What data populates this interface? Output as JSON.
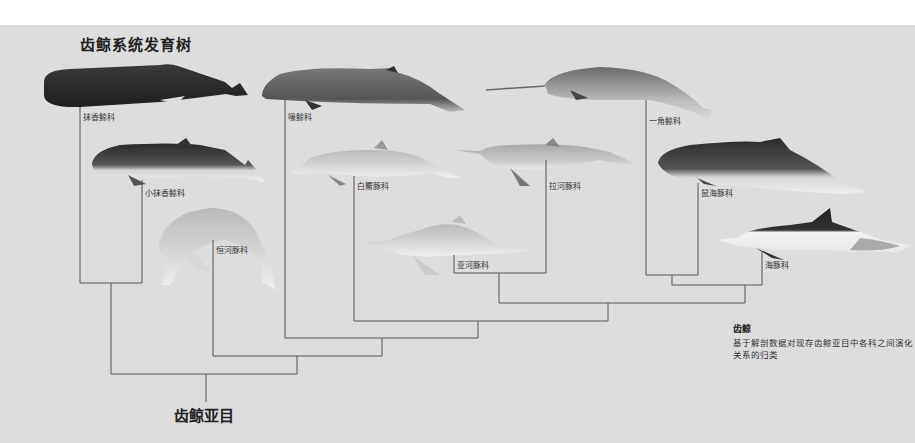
{
  "title": "齿鲸系统发育树",
  "root_label": "齿鲸亚目",
  "caption": {
    "title": "齿鲸",
    "text": "基于解剖数据对现存齿鲸亚目中各科之间演化关系的归类"
  },
  "families": [
    {
      "id": "physeteridae",
      "label": "抹香鲸科",
      "illustration": "sperm-whale"
    },
    {
      "id": "kogiidae",
      "label": "小抹香鲸科",
      "illustration": "pygmy-sperm-whale"
    },
    {
      "id": "platanistidae",
      "label": "恒河豚科",
      "illustration": "ganges-river-dolphin"
    },
    {
      "id": "ziphiidae",
      "label": "喙鲸科",
      "illustration": "beaked-whale"
    },
    {
      "id": "lipotidae",
      "label": "白鱀豚科",
      "illustration": "baiji"
    },
    {
      "id": "iniidae",
      "label": "亚河豚科",
      "illustration": "amazon-river-dolphin"
    },
    {
      "id": "pontoporiidae",
      "label": "拉河豚科",
      "illustration": "la-plata-dolphin"
    },
    {
      "id": "monodontidae",
      "label": "一角鲸科",
      "illustration": "narwhal"
    },
    {
      "id": "phocoenidae",
      "label": "鼠海豚科",
      "illustration": "porpoise"
    },
    {
      "id": "delphinidae",
      "label": "海豚科",
      "illustration": "common-dolphin"
    }
  ],
  "colors": {
    "background": "#dddddd",
    "line": "#555555"
  }
}
